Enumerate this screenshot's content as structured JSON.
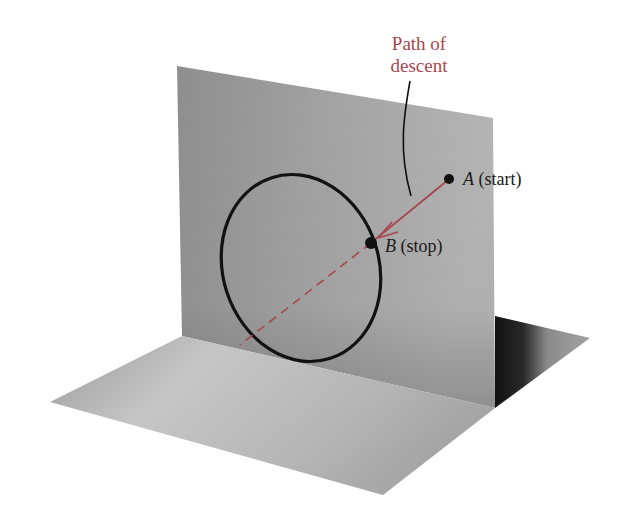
{
  "annotation": {
    "line1": "Path of",
    "line2": "descent"
  },
  "points": {
    "A": {
      "letter": "A",
      "desc": "(start)"
    },
    "B": {
      "letter": "B",
      "desc": "(stop)"
    }
  },
  "colors": {
    "path": "#a8474f",
    "curve": "#111111",
    "background": "#ffffff"
  }
}
